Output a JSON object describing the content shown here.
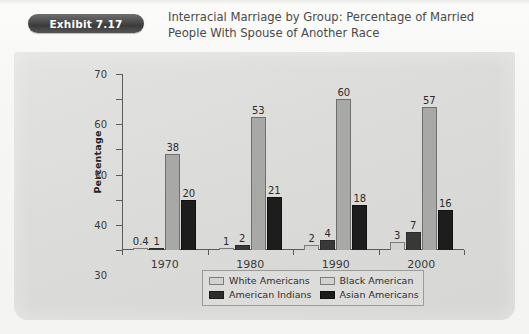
{
  "exhibit": {
    "badge_label": "Exhibit 7.17",
    "title_line1": "Interracial Marriage by Group: Percentage of Married",
    "title_line2": "People With Spouse of Another Race"
  },
  "colors": {
    "page_background": "#f6f6f5",
    "panel_background": "#dcdcda",
    "badge": "#4a4a4a",
    "series_white_americans": "#d2d2d0",
    "series_american_indians": "#383838",
    "series_black_american": "#a8a8a6",
    "series_asian_americans": "#1d1d1d",
    "axis": "#5b5b5b",
    "text": "#2e2e2e"
  },
  "chart_data": {
    "type": "bar",
    "title": "Interracial Marriage by Group: Percentage of Married People With Spouse of Another Race",
    "xlabel": "",
    "ylabel": "Percentage",
    "ylim": [
      0,
      70
    ],
    "yticks": [
      0,
      10,
      20,
      30,
      40,
      50,
      60,
      70
    ],
    "ytick_labels": [
      "0",
      "10",
      "",
      "30",
      "40",
      "50",
      "60",
      "70"
    ],
    "grid": false,
    "legend_position": "bottom",
    "categories": [
      "1970",
      "1980",
      "1990",
      "2000"
    ],
    "series": [
      {
        "name": "White Americans",
        "color": "#d2d2d0",
        "values": [
          0.4,
          1,
          2,
          3
        ],
        "labels": [
          "0.4",
          "1",
          "2",
          "3"
        ]
      },
      {
        "name": "American Indians",
        "color": "#383838",
        "values": [
          1,
          2,
          4,
          7
        ],
        "labels": [
          "1",
          "2",
          "4",
          "7"
        ]
      },
      {
        "name": "Black American",
        "color": "#a8a8a6",
        "values": [
          38,
          53,
          60,
          57
        ],
        "labels": [
          "38",
          "53",
          "60",
          "57"
        ]
      },
      {
        "name": "Asian Americans",
        "color": "#1d1d1d",
        "values": [
          20,
          21,
          18,
          16
        ],
        "labels": [
          "20",
          "21",
          "18",
          "16"
        ]
      }
    ]
  },
  "legend": {
    "entries": [
      {
        "label": "White Americans",
        "swatch": "light"
      },
      {
        "label": "Black American",
        "swatch": "dark"
      },
      {
        "label": "American Indians",
        "swatch": "light"
      },
      {
        "label": "Asian Americans",
        "swatch": "dark"
      }
    ]
  }
}
